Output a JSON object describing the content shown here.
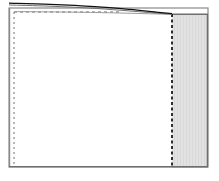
{
  "figure": {
    "title": "",
    "background_color": "#ffffff",
    "width": 219,
    "height": 181
  },
  "colors": {
    "frame_stroke": "#8a8a8a",
    "frame_fill": "#ffffff",
    "dashed_stroke": "#9a9a9a",
    "dashed_stroke_dark": "#1a1a1a",
    "shaded_fill": "#e2e2e2",
    "shaded_stripe": "#d8d8d8",
    "shaded_border": "#6e6e6e",
    "curve_dark": "#111111",
    "curve_gray": "#707070",
    "curve_light": "#9c9c9c"
  },
  "frame": {
    "name": "domain-boundary",
    "x": 9,
    "y": 8,
    "width": 199,
    "height": 159,
    "stroke_width": 1.2
  },
  "dashed_left_edge": {
    "name": "inlet-boundary",
    "x": 14,
    "y_top": 12,
    "y_bottom": 164,
    "dash_pattern": "2,3",
    "stroke_width": 1.4
  },
  "dashed_top_edge": {
    "name": "farfield-boundary",
    "y": 12,
    "x_left": 14,
    "x_right": 120,
    "dash_pattern": "3,3",
    "stroke_width": 1.4
  },
  "dashed_interface": {
    "name": "outflow-interface",
    "x": 172,
    "y_top": 14,
    "y_bottom": 166,
    "dash_pattern": "3,2.5",
    "stroke_width": 1.8
  },
  "shaded_region": {
    "name": "sponge-zone",
    "label": "",
    "x": 172,
    "y": 14,
    "width": 36,
    "height": 153,
    "stripe_spacing": 3,
    "stripe_width": 1
  },
  "curves": [
    {
      "name": "upper-characteristic",
      "color_key": "curve_dark",
      "stroke_width": 1.3,
      "points": [
        [
          9,
          3.2
        ],
        [
          50,
          4.4
        ],
        [
          95,
          6.6
        ],
        [
          130,
          9.4
        ],
        [
          155,
          12.0
        ],
        [
          172,
          13.6
        ]
      ]
    },
    {
      "name": "mid-characteristic",
      "color_key": "curve_gray",
      "stroke_width": 1.0,
      "points": [
        [
          9,
          5.0
        ],
        [
          50,
          6.2
        ],
        [
          95,
          8.4
        ],
        [
          130,
          11.0
        ],
        [
          155,
          13.0
        ],
        [
          172,
          14.2
        ]
      ]
    },
    {
      "name": "lower-characteristic",
      "color_key": "curve_light",
      "stroke_width": 1.0,
      "points": [
        [
          14,
          11.6
        ],
        [
          60,
          12.0
        ],
        [
          100,
          12.6
        ],
        [
          135,
          13.4
        ],
        [
          158,
          14.0
        ],
        [
          172,
          14.4
        ]
      ]
    }
  ],
  "axes": {
    "x_label": "",
    "y_label": "",
    "tick_labels": []
  },
  "chart_data": {
    "type": "line",
    "title": "",
    "xlabel": "",
    "ylabel": "",
    "xlim": [
      9,
      208
    ],
    "ylim": [
      167,
      0
    ],
    "grid": false,
    "legend": "none",
    "annotations": [],
    "series": [
      {
        "name": "upper-characteristic",
        "x": [
          9,
          50,
          95,
          130,
          155,
          172
        ],
        "y": [
          3.2,
          4.4,
          6.6,
          9.4,
          12.0,
          13.6
        ]
      },
      {
        "name": "mid-characteristic",
        "x": [
          9,
          50,
          95,
          130,
          155,
          172
        ],
        "y": [
          5.0,
          6.2,
          8.4,
          11.0,
          13.0,
          14.2
        ]
      },
      {
        "name": "lower-characteristic",
        "x": [
          14,
          60,
          100,
          135,
          158,
          172
        ],
        "y": [
          11.6,
          12.0,
          12.6,
          13.4,
          14.0,
          14.4
        ]
      }
    ],
    "regions": [
      {
        "name": "sponge-zone",
        "x0": 172,
        "x1": 208,
        "y0": 14,
        "y1": 167,
        "fill": "#e2e2e2"
      }
    ]
  }
}
